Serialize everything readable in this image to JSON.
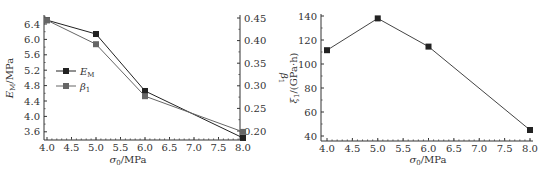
{
  "chart_data": [
    {
      "type": "line",
      "title": "",
      "x": [
        4.0,
        5.0,
        6.0,
        8.0
      ],
      "xlabel": "σ0/MPa",
      "xlim": [
        3.9,
        8.0
      ],
      "xticks": [
        "4.0",
        "4.5",
        "5.0",
        "5.5",
        "6.0",
        "6.5",
        "7.0",
        "7.5",
        "8.0"
      ],
      "ylabel": "EM/MPa",
      "ylim": [
        3.4,
        6.5
      ],
      "yticks": [
        "3.6",
        "4.0",
        "4.4",
        "4.8",
        "5.2",
        "5.6",
        "6.0",
        "6.4"
      ],
      "y2label": "β1",
      "y2lim": [
        0.18,
        0.45
      ],
      "y2ticks": [
        "0.20",
        "0.25",
        "0.30",
        "0.35",
        "0.40",
        "0.45"
      ],
      "legend_position": "left-middle",
      "grid": false,
      "series": [
        {
          "name": "EM",
          "axis": "left",
          "marker": "square",
          "color": "#222222",
          "values": [
            6.5,
            6.14,
            4.66,
            3.44
          ]
        },
        {
          "name": "β1",
          "axis": "right",
          "marker": "square",
          "color": "#666666",
          "values": [
            0.445,
            0.392,
            0.277,
            0.198
          ]
        }
      ]
    },
    {
      "type": "line",
      "title": "",
      "x": [
        4.0,
        5.0,
        6.0,
        8.0
      ],
      "xlabel": "σ0/MPa",
      "xlim": [
        3.9,
        8.0
      ],
      "xticks": [
        "4.0",
        "4.5",
        "5.0",
        "5.5",
        "6.0",
        "6.5",
        "7.0",
        "7.5",
        "8.0"
      ],
      "ylabel": "ξ1/(GPa·h)",
      "ylim": [
        36,
        140
      ],
      "yticks": [
        "40",
        "60",
        "80",
        "100",
        "120",
        "140"
      ],
      "grid": false,
      "series": [
        {
          "name": "ξ1",
          "marker": "square",
          "color": "#222222",
          "values": [
            111.5,
            138,
            114.5,
            45
          ]
        }
      ]
    }
  ],
  "labels": {
    "left_xlabel_main": "σ",
    "left_xlabel_sub": "0",
    "left_xlabel_unit": "/MPa",
    "left_ylabel_main": "E",
    "left_ylabel_sub": "M",
    "left_ylabel_unit": "/MPa",
    "left_y2label_main": "β",
    "left_y2label_sub": "1",
    "legend_em_main": "E",
    "legend_em_sub": "M",
    "legend_beta_main": "β",
    "legend_beta_sub": "1",
    "right_xlabel_main": "σ",
    "right_xlabel_sub": "0",
    "right_xlabel_unit": "/MPa",
    "right_ylabel_main": "ξ",
    "right_ylabel_sub": "1",
    "right_ylabel_unit": "/(GPa·h)"
  }
}
